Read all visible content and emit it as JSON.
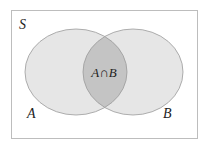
{
  "diagram": {
    "type": "venn",
    "universe_label": "S",
    "sets": [
      {
        "label": "A"
      },
      {
        "label": "B"
      }
    ],
    "intersection_label": "A∩B",
    "colors": {
      "background": "#ffffff",
      "border": "#bdbdbd",
      "set_fill": "#e6e6e6",
      "intersection_fill": "#c4c4c4",
      "set_stroke": "#9a9a9a"
    }
  }
}
